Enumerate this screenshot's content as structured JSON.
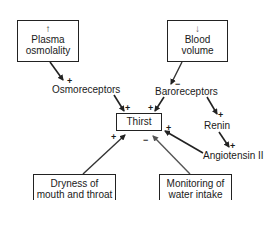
{
  "diagram": {
    "nodes": {
      "plasma": {
        "arrow": "↑",
        "line1": "Plasma",
        "line2": "osmolality"
      },
      "blood": {
        "arrow": "↓",
        "line1": "Blood",
        "line2": "volume"
      },
      "osmoreceptors": {
        "label": "Osmoreceptors"
      },
      "baroreceptors": {
        "label": "Baroreceptors"
      },
      "thirst": {
        "label": "Thirst"
      },
      "renin": {
        "label": "Renin"
      },
      "angiotensin": {
        "label": "Angiotensin II"
      },
      "dryness": {
        "line1": "Dryness of",
        "line2": "mouth and throat"
      },
      "monitoring": {
        "line1": "Monitoring of",
        "line2": "water intake"
      }
    },
    "edges": [
      {
        "from": "Plasma osmolality",
        "to": "Osmoreceptors",
        "sign": "+"
      },
      {
        "from": "Blood volume",
        "to": "Baroreceptors",
        "sign": "−"
      },
      {
        "from": "Osmoreceptors",
        "to": "Thirst",
        "sign": "+"
      },
      {
        "from": "Baroreceptors",
        "to": "Thirst",
        "sign": "+"
      },
      {
        "from": "Baroreceptors",
        "to": "Renin",
        "sign": "+"
      },
      {
        "from": "Renin",
        "to": "Angiotensin II",
        "sign": "+"
      },
      {
        "from": "Angiotensin II",
        "to": "Thirst",
        "sign": "+"
      },
      {
        "from": "Dryness of mouth and throat",
        "to": "Thirst",
        "sign": "+"
      },
      {
        "from": "Monitoring of water intake",
        "to": "Thirst",
        "sign": "−"
      }
    ],
    "signs": {
      "plus": "+",
      "minus": "−"
    }
  }
}
